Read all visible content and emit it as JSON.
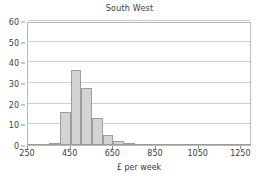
{
  "chart_data": {
    "type": "bar",
    "title": "South West",
    "subtitle": "",
    "xlabel": "£ per week",
    "ylabel": "",
    "xlim": [
      250,
      1300
    ],
    "ylim": [
      0,
      60
    ],
    "grid": true,
    "legend": null,
    "bin_width": 50,
    "x_ticks": [
      250,
      450,
      650,
      850,
      1050,
      1250
    ],
    "x_tick_labels": [
      "250",
      "450",
      "650",
      "850",
      "1050",
      "1250"
    ],
    "y_ticks": [
      0,
      10,
      20,
      30,
      40,
      50,
      60
    ],
    "y_tick_labels": [
      "0",
      "10",
      "20",
      "30",
      "40",
      "50",
      "60"
    ],
    "bin_starts": [
      350,
      400,
      450,
      500,
      550,
      600,
      650,
      700
    ],
    "categories": [
      "350-400",
      "400-450",
      "450-500",
      "500-550",
      "550-600",
      "600-650",
      "650-700",
      "700-750"
    ],
    "values": [
      1,
      16,
      36.5,
      27.5,
      13,
      5,
      2,
      0.7
    ],
    "bar_color": "#d3d3d3",
    "bar_edge_color": "#9d9d9d",
    "grid_color": "#cfcfcf",
    "axis_color": "#b9b9b9",
    "text_color": "#3d3d3d"
  }
}
